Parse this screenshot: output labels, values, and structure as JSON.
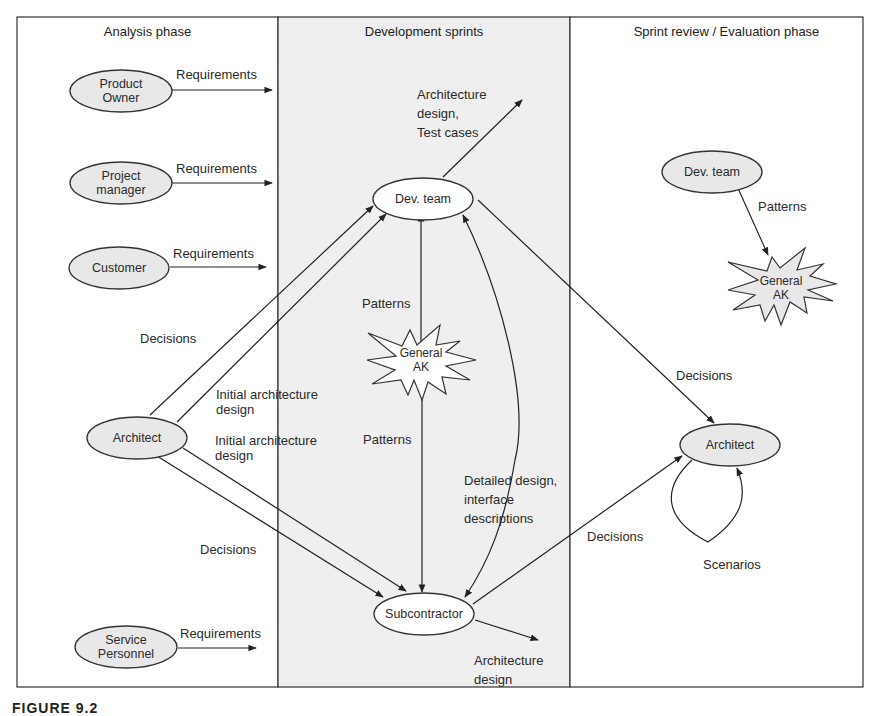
{
  "lanes": [
    {
      "title": "Analysis phase",
      "fill": "#ffffff"
    },
    {
      "title": "Development sprints",
      "fill": "#eeeeee"
    },
    {
      "title": "Sprint review / Evaluation phase",
      "fill": "#ffffff"
    }
  ],
  "nodes": {
    "product_owner": {
      "label": "Product\nOwner",
      "shape": "ellipse",
      "fill": "#e8e8e8"
    },
    "project_manager": {
      "label": "Project\nmanager",
      "shape": "ellipse",
      "fill": "#e8e8e8"
    },
    "customer": {
      "label": "Customer",
      "shape": "ellipse",
      "fill": "#e8e8e8"
    },
    "architect_left": {
      "label": "Architect",
      "shape": "ellipse",
      "fill": "#e8e8e8"
    },
    "service_personnel": {
      "label": "Service\nPersonnel",
      "shape": "ellipse",
      "fill": "#e8e8e8"
    },
    "dev_team_mid": {
      "label": "Dev. team",
      "shape": "ellipse",
      "fill": "#ffffff"
    },
    "general_ak_mid": {
      "label": "General\nAK",
      "shape": "star",
      "fill": "#ffffff"
    },
    "subcontractor": {
      "label": "Subcontractor",
      "shape": "ellipse",
      "fill": "#ffffff"
    },
    "dev_team_right": {
      "label": "Dev. team",
      "shape": "ellipse",
      "fill": "#e8e8e8"
    },
    "general_ak_right": {
      "label": "General\nAK",
      "shape": "star",
      "fill": "#e8e8e8"
    },
    "architect_right": {
      "label": "Architect",
      "shape": "ellipse",
      "fill": "#e8e8e8"
    }
  },
  "edge_labels": {
    "po_req": "Requirements",
    "pm_req": "Requirements",
    "cust_req": "Requirements",
    "sp_req": "Requirements",
    "arch_decisions_up": "Decisions",
    "arch_initial_1": "Initial architecture\ndesign",
    "arch_initial_2": "Initial architecture\ndesign",
    "arch_decisions_down": "Decisions",
    "dev_arch_test": "Architecture\ndesign,\nTest cases",
    "patterns_up": "Patterns",
    "patterns_down": "Patterns",
    "detailed_design": "Detailed design,\ninterface\ndescriptions",
    "sub_arch_design": "Architecture\ndesign",
    "dev_decisions_right": "Decisions",
    "sub_decisions_right": "Decisions",
    "right_patterns": "Patterns",
    "scenarios": "Scenarios"
  },
  "caption": "FIGURE 9.2"
}
